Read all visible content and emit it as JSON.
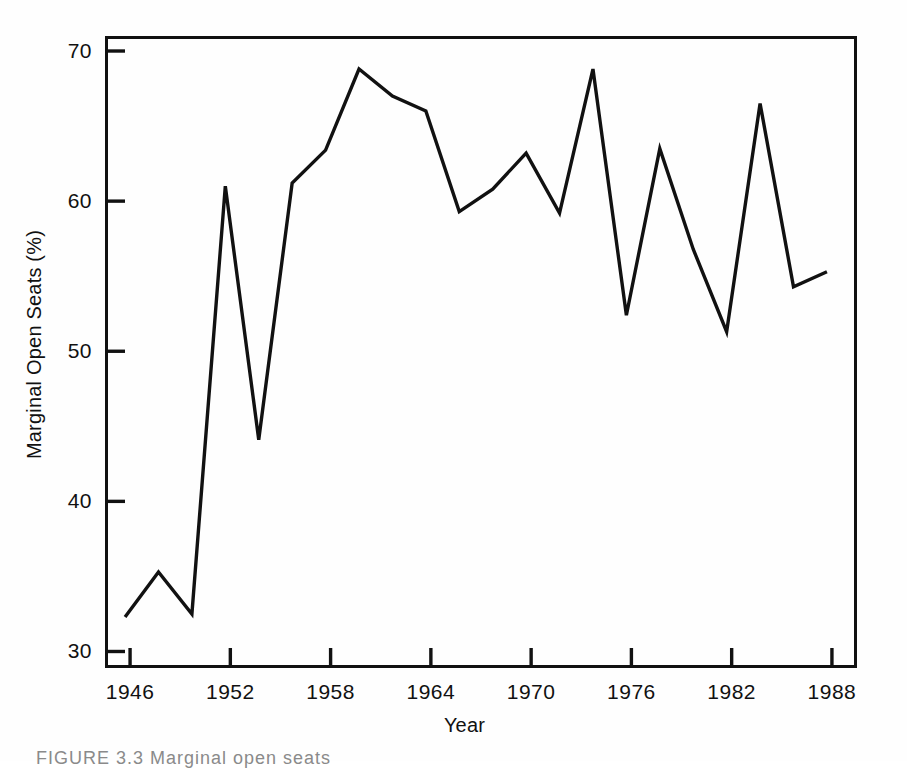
{
  "figure": {
    "caption": "FIGURE 3.3  Marginal open seats"
  },
  "chart_data": {
    "type": "line",
    "title": "",
    "xlabel": "Year",
    "ylabel": "Marginal Open Seats (%)",
    "xlim": [
      1944.5,
      1989.5
    ],
    "ylim": [
      28.9,
      71.0
    ],
    "xticks": [
      1946,
      1952,
      1958,
      1964,
      1970,
      1976,
      1982,
      1988
    ],
    "yticks": [
      30,
      40,
      50,
      60,
      70
    ],
    "xtick_labels": [
      "1946",
      "1952",
      "1958",
      "1964",
      "1970",
      "1976",
      "1982",
      "1988"
    ],
    "ytick_labels": [
      "30",
      "40",
      "50",
      "60",
      "70"
    ],
    "grid": false,
    "legend": false,
    "line_color": "#111111",
    "line_width": 3.4,
    "x": [
      1945.7,
      1947.7,
      1949.7,
      1951.7,
      1953.7,
      1955.7,
      1957.7,
      1959.7,
      1961.7,
      1963.7,
      1965.7,
      1967.7,
      1969.7,
      1971.7,
      1973.7,
      1975.7,
      1977.7,
      1979.7,
      1981.7,
      1983.7,
      1985.7,
      1987.7
    ],
    "values": [
      32.3,
      35.3,
      32.5,
      61.0,
      44.1,
      61.2,
      63.4,
      68.8,
      67.0,
      66.0,
      59.3,
      60.8,
      63.2,
      59.2,
      68.8,
      52.4,
      63.5,
      56.8,
      51.3,
      66.5,
      54.3,
      55.3
    ],
    "series": [
      {
        "name": "Marginal Open Seats (%)",
        "points": [
          {
            "year": 1946,
            "value": 32.3
          },
          {
            "year": 1948,
            "value": 35.3
          },
          {
            "year": 1950,
            "value": 32.5
          },
          {
            "year": 1952,
            "value": 61.0
          },
          {
            "year": 1954,
            "value": 44.1
          },
          {
            "year": 1956,
            "value": 61.2
          },
          {
            "year": 1958,
            "value": 63.4
          },
          {
            "year": 1960,
            "value": 68.8
          },
          {
            "year": 1962,
            "value": 67.0
          },
          {
            "year": 1964,
            "value": 66.0
          },
          {
            "year": 1966,
            "value": 59.3
          },
          {
            "year": 1968,
            "value": 60.8
          },
          {
            "year": 1970,
            "value": 63.2
          },
          {
            "year": 1972,
            "value": 59.2
          },
          {
            "year": 1974,
            "value": 68.8
          },
          {
            "year": 1976,
            "value": 52.4
          },
          {
            "year": 1978,
            "value": 63.5
          },
          {
            "year": 1980,
            "value": 56.8
          },
          {
            "year": 1982,
            "value": 51.3
          },
          {
            "year": 1984,
            "value": 66.5
          },
          {
            "year": 1986,
            "value": 54.3
          },
          {
            "year": 1988,
            "value": 55.3
          }
        ]
      }
    ]
  }
}
